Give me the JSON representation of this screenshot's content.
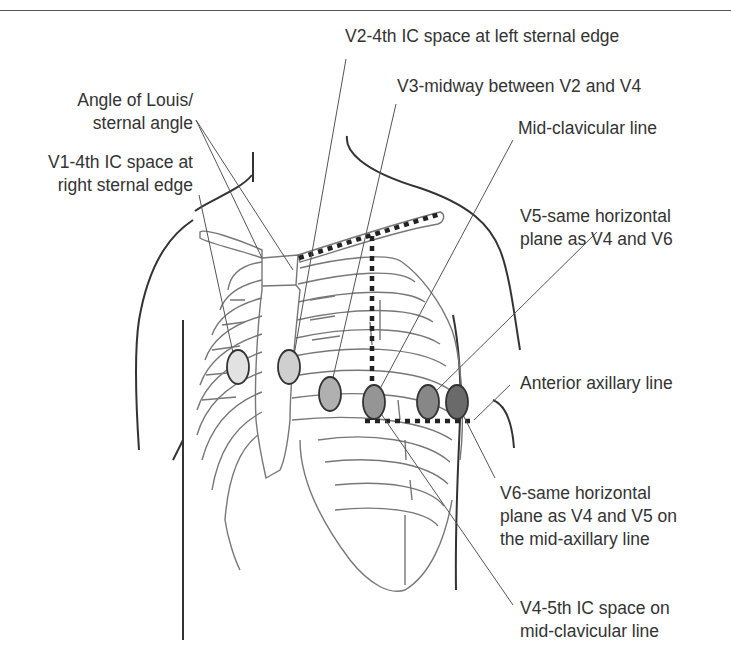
{
  "diagram": {
    "colors": {
      "text": "#333333",
      "outline": "#333333",
      "rib": "#777777",
      "leader": "#666666",
      "v1": "#e2e2e2",
      "v2": "#cfcfcf",
      "v3": "#b0b0b0",
      "v4": "#959595",
      "v5": "#878787",
      "v6": "#6a6a6a"
    },
    "labels": {
      "angle_of_louis": {
        "line1": "Angle of Louis/",
        "line2": "sternal angle"
      },
      "v1": {
        "line1": "V1-4th IC space at",
        "line2": "right sternal edge"
      },
      "v2": {
        "line1": "V2-4th IC space at left sternal edge"
      },
      "v3": {
        "line1": "V3-midway between V2 and V4"
      },
      "mid_clavicular": {
        "line1": "Mid-clavicular line"
      },
      "v5": {
        "line1": "V5-same horizontal",
        "line2": "plane as V4 and V6"
      },
      "anterior_axillary": {
        "line1": "Anterior axillary line"
      },
      "v6": {
        "line1": "V6-same horizontal",
        "line2": "plane as V4 and V5 on",
        "line3": "the mid-axillary line"
      },
      "v4": {
        "line1": "V4-5th IC space on",
        "line2": "mid-clavicular line"
      }
    },
    "electrodes": [
      {
        "id": "V1",
        "cx": 238,
        "cy": 367,
        "rx": 11,
        "ry": 17
      },
      {
        "id": "V2",
        "cx": 289,
        "cy": 367,
        "rx": 11,
        "ry": 17
      },
      {
        "id": "V3",
        "cx": 330,
        "cy": 394,
        "rx": 11,
        "ry": 17
      },
      {
        "id": "V4",
        "cx": 374,
        "cy": 402,
        "rx": 11,
        "ry": 17
      },
      {
        "id": "V5",
        "cx": 428,
        "cy": 402,
        "rx": 11,
        "ry": 17
      },
      {
        "id": "V6",
        "cx": 457,
        "cy": 402,
        "rx": 11,
        "ry": 17
      }
    ]
  }
}
